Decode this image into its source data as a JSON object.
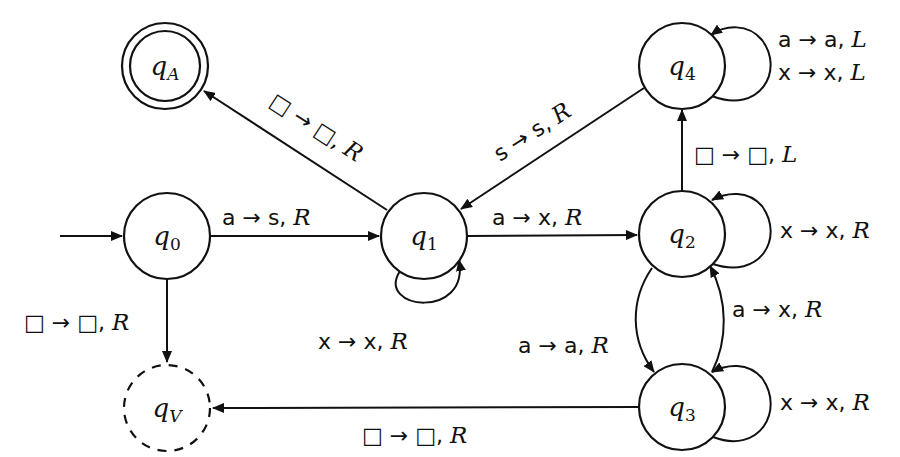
{
  "diagram": {
    "title": "",
    "type": "turing-machine-state-diagram",
    "start_state": "q0",
    "nodes": [
      {
        "id": "q0",
        "base": "q",
        "sub": "0",
        "sub_italic": false,
        "x": 167,
        "y": 236,
        "kind": "start"
      },
      {
        "id": "q1",
        "base": "q",
        "sub": "1",
        "sub_italic": false,
        "x": 424,
        "y": 236,
        "kind": "normal"
      },
      {
        "id": "q2",
        "base": "q",
        "sub": "2",
        "sub_italic": false,
        "x": 682,
        "y": 234,
        "kind": "normal"
      },
      {
        "id": "q3",
        "base": "q",
        "sub": "3",
        "sub_italic": false,
        "x": 682,
        "y": 407,
        "kind": "normal"
      },
      {
        "id": "q4",
        "base": "q",
        "sub": "4",
        "sub_italic": false,
        "x": 682,
        "y": 66,
        "kind": "normal"
      },
      {
        "id": "qA",
        "base": "q",
        "sub": "A",
        "sub_italic": true,
        "x": 165,
        "y": 66,
        "kind": "accept"
      },
      {
        "id": "qV",
        "base": "q",
        "sub": "V",
        "sub_italic": true,
        "x": 167,
        "y": 408,
        "kind": "reject"
      }
    ],
    "edges": [
      {
        "from": "q0",
        "to": "q1",
        "read": "a",
        "write": "s",
        "move": "R"
      },
      {
        "from": "q0",
        "to": "qV",
        "read": "□",
        "write": "□",
        "move": "R"
      },
      {
        "from": "q1",
        "to": "qA",
        "read": "□",
        "write": "□",
        "move": "R"
      },
      {
        "from": "q1",
        "to": "q1",
        "read": "x",
        "write": "x",
        "move": "R"
      },
      {
        "from": "q1",
        "to": "q2",
        "read": "a",
        "write": "x",
        "move": "R"
      },
      {
        "from": "q4",
        "to": "q1",
        "read": "s",
        "write": "s",
        "move": "R"
      },
      {
        "from": "q4",
        "to": "q4",
        "read": "a",
        "write": "a",
        "move": "L"
      },
      {
        "from": "q4",
        "to": "q4",
        "read": "x",
        "write": "x",
        "move": "L"
      },
      {
        "from": "q2",
        "to": "q4",
        "read": "□",
        "write": "□",
        "move": "L"
      },
      {
        "from": "q2",
        "to": "q2",
        "read": "x",
        "write": "x",
        "move": "R"
      },
      {
        "from": "q2",
        "to": "q3",
        "read": "a",
        "write": "a",
        "move": "R"
      },
      {
        "from": "q3",
        "to": "q2",
        "read": "a",
        "write": "x",
        "move": "R"
      },
      {
        "from": "q3",
        "to": "q3",
        "read": "x",
        "write": "x",
        "move": "R"
      },
      {
        "from": "q3",
        "to": "qV",
        "read": "□",
        "write": "□",
        "move": "R"
      }
    ],
    "labels": {
      "q0_q1": {
        "text": "a → s, ",
        "dir": "R"
      },
      "q0_qV": {
        "text": "□ → □, ",
        "dir": "R"
      },
      "q1_qA": {
        "text": "□ → □, ",
        "dir": "R"
      },
      "q1_loop": {
        "text": "x → x, ",
        "dir": "R"
      },
      "q1_q2": {
        "text": "a → x, ",
        "dir": "R"
      },
      "q4_q1": {
        "text": "s → s, ",
        "dir": "R"
      },
      "q4_loop_1": {
        "text": "a → a, ",
        "dir": "L"
      },
      "q4_loop_2": {
        "text": "x → x, ",
        "dir": "L"
      },
      "q2_q4": {
        "text": "□ → □, ",
        "dir": "L"
      },
      "q2_loop": {
        "text": "x → x, ",
        "dir": "R"
      },
      "q2_q3": {
        "text": "a → a, ",
        "dir": "R"
      },
      "q3_q2": {
        "text": "a → x, ",
        "dir": "R"
      },
      "q3_loop": {
        "text": "x → x, ",
        "dir": "R"
      },
      "q3_qV": {
        "text": "□ → □, ",
        "dir": "R"
      }
    }
  }
}
